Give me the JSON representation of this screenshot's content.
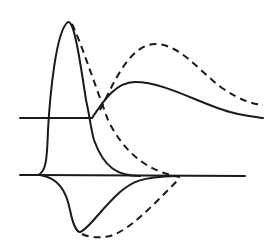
{
  "figure": {
    "stroke_color": "#1a1a1a",
    "background": "#ffffff",
    "upper_trace": {
      "baseline_y": 118,
      "solid_peak": {
        "x": 68,
        "y": 22
      },
      "solid_secondary_hump": {
        "x": 135,
        "y": 82
      },
      "dashed_secondary_hump": {
        "x": 155,
        "y": 45
      }
    },
    "lower_trace": {
      "baseline_y": 176,
      "solid_trough": {
        "x": 80,
        "y": 232
      },
      "dashed_trough": {
        "x": 98,
        "y": 237
      },
      "solid_rejoin_x": 140,
      "dashed_rejoin_x": 180
    },
    "line_styles": [
      "solid",
      "dashed"
    ]
  }
}
